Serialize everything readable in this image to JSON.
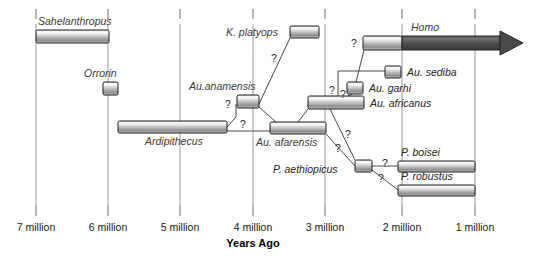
{
  "figure": {
    "axis_title": "Years Ago",
    "axis_ticks": [
      {
        "label": "7 million",
        "value": 7,
        "x": 36
      },
      {
        "label": "6 million",
        "value": 6,
        "x": 108
      },
      {
        "label": "5 million",
        "value": 5,
        "x": 180
      },
      {
        "label": "4 million",
        "value": 4,
        "x": 253
      },
      {
        "label": "3 million",
        "value": 3,
        "x": 325
      },
      {
        "label": "2 million",
        "value": 2,
        "x": 402
      },
      {
        "label": "1 million",
        "value": 1,
        "x": 475
      }
    ]
  },
  "chart_data": {
    "type": "bar",
    "title": "",
    "xlabel": "Years Ago",
    "ylabel": "",
    "xlim": [
      7.5,
      0.7
    ],
    "grid": true,
    "legend": "none",
    "orientation": "horizontal-ranges",
    "categories": [
      "Sahelanthropus",
      "Orrorin",
      "Ardipithecus",
      "Au.anamensis",
      "K. platyops",
      "Au. afarensis",
      "Au. africanus",
      "Au. garhi",
      "Au. sediba",
      "Homo",
      "P. aethiopicus",
      "P. boisei",
      "P. robustus"
    ],
    "ranges_mya": [
      {
        "name": "Sahelanthropus",
        "start": 7.0,
        "end": 6.0
      },
      {
        "name": "Orrorin",
        "start": 6.08,
        "end": 5.88
      },
      {
        "name": "Ardipithecus",
        "start": 5.86,
        "end": 4.36
      },
      {
        "name": "Au.anamensis",
        "start": 4.2,
        "end": 3.9
      },
      {
        "name": "K. platyops",
        "start": 3.5,
        "end": 3.1
      },
      {
        "name": "Au. afarensis",
        "start": 3.75,
        "end": 3.0
      },
      {
        "name": "Au. africanus",
        "start": 3.22,
        "end": 2.46
      },
      {
        "name": "Au. garhi",
        "start": 2.76,
        "end": 2.56
      },
      {
        "name": "Au. sediba",
        "start": 2.24,
        "end": 2.03
      },
      {
        "name": "Homo",
        "start": 2.54,
        "end": 0.2
      },
      {
        "name": "P. aethiopicus",
        "start": 2.65,
        "end": 2.42
      },
      {
        "name": "P. boisei",
        "start": 2.05,
        "end": 1.0
      },
      {
        "name": "P. robustus",
        "start": 2.05,
        "end": 1.0
      }
    ]
  },
  "taxa": [
    {
      "id": "sahelanthropus",
      "label": "Sahelanthropus",
      "bar": {
        "x": 36,
        "y": 30,
        "w": 73,
        "h": 13
      },
      "label_pos": {
        "x": 38,
        "y": 25,
        "anchor": "start"
      },
      "style": "light"
    },
    {
      "id": "orrorin",
      "label": "Orrorin",
      "bar": {
        "x": 103,
        "y": 82,
        "w": 15,
        "h": 13
      },
      "label_pos": {
        "x": 84,
        "y": 77,
        "anchor": "start"
      },
      "style": "light"
    },
    {
      "id": "ardipithecus",
      "label": "Ardipithecus",
      "bar": {
        "x": 118,
        "y": 121,
        "w": 109,
        "h": 12
      },
      "label_pos": {
        "x": 145,
        "y": 145,
        "anchor": "start"
      },
      "style": "light"
    },
    {
      "id": "au-anamensis",
      "label": "Au.anamensis",
      "bar": {
        "x": 237,
        "y": 95,
        "w": 22,
        "h": 13
      },
      "label_pos": {
        "x": 189,
        "y": 90,
        "anchor": "start"
      },
      "style": "light"
    },
    {
      "id": "k-platyops",
      "label": "K. platyops",
      "bar": {
        "x": 290,
        "y": 26,
        "w": 29,
        "h": 12
      },
      "label_pos": {
        "x": 226,
        "y": 36,
        "anchor": "start"
      },
      "style": "light"
    },
    {
      "id": "au-afarensis",
      "label": "Au. afarensis",
      "bar": {
        "x": 270,
        "y": 122,
        "w": 56,
        "h": 12
      },
      "label_pos": {
        "x": 256,
        "y": 146,
        "anchor": "start"
      },
      "style": "light"
    },
    {
      "id": "au-africanus",
      "label": "Au. africanus",
      "bar": {
        "x": 308,
        "y": 96,
        "w": 56,
        "h": 13
      },
      "label_pos": {
        "x": 370,
        "y": 107,
        "anchor": "start"
      },
      "style": "light"
    },
    {
      "id": "au-garhi",
      "label": "Au. garhi",
      "bar": {
        "x": 347,
        "y": 82,
        "w": 16,
        "h": 12
      },
      "label_pos": {
        "x": 369,
        "y": 92,
        "anchor": "start"
      },
      "style": "light"
    },
    {
      "id": "au-sediba",
      "label": "Au. sediba",
      "bar": {
        "x": 385,
        "y": 66,
        "w": 16,
        "h": 12
      },
      "label_pos": {
        "x": 407,
        "y": 76,
        "anchor": "start"
      },
      "style": "light"
    },
    {
      "id": "homo",
      "label": "Homo",
      "bar": {
        "x": 363,
        "y": 36,
        "w": 39,
        "h": 14
      },
      "label_pos": {
        "x": 425,
        "y": 31,
        "anchor": "middle"
      },
      "style": "light-then-dark"
    },
    {
      "id": "p-aethiopicus",
      "label": "P. aethiopicus",
      "bar": {
        "x": 355,
        "y": 160,
        "w": 17,
        "h": 12
      },
      "label_pos": {
        "x": 273,
        "y": 173,
        "anchor": "start"
      },
      "style": "light"
    },
    {
      "id": "p-boisei",
      "label": "P. boisei",
      "bar": {
        "x": 398,
        "y": 161,
        "w": 77,
        "h": 11
      },
      "label_pos": {
        "x": 401,
        "y": 156,
        "anchor": "start"
      },
      "style": "light"
    },
    {
      "id": "p-robustus",
      "label": "P. robustus",
      "bar": {
        "x": 398,
        "y": 185,
        "w": 77,
        "h": 11
      },
      "label_pos": {
        "x": 401,
        "y": 180,
        "anchor": "start"
      },
      "style": "light"
    }
  ],
  "uncertainty_marks": [
    {
      "id": "q-ardi-anam",
      "label": "?",
      "x": 228,
      "y": 108
    },
    {
      "id": "q-ardi-afar",
      "label": "?",
      "x": 243,
      "y": 128
    },
    {
      "id": "q-anam-platyops",
      "label": "?",
      "x": 274,
      "y": 62
    },
    {
      "id": "q-afar-africanus",
      "label": "?",
      "x": 332,
      "y": 94
    },
    {
      "id": "q-garhi",
      "label": "?",
      "x": 343,
      "y": 98
    },
    {
      "id": "q-homo",
      "label": "?",
      "x": 354,
      "y": 47
    },
    {
      "id": "q-aethiopicus-a",
      "label": "?",
      "x": 348,
      "y": 138
    },
    {
      "id": "q-aethiopicus-b",
      "label": "?",
      "x": 338,
      "y": 152
    },
    {
      "id": "q-boisei",
      "label": "?",
      "x": 385,
      "y": 167
    },
    {
      "id": "q-robustus",
      "label": "?",
      "x": 381,
      "y": 182
    }
  ],
  "connectors": [
    {
      "id": "ardipithecus-to-anamensis",
      "points": "227,127 236,117 236,104"
    },
    {
      "id": "ardipithecus-to-afarensis",
      "points": "227,131 270,131"
    },
    {
      "id": "anamensis-to-platyops",
      "points": "259,104 290,38"
    },
    {
      "id": "anamensis-to-afarensis",
      "points": "259,107 276,122"
    },
    {
      "id": "afarensis-to-africanus",
      "points": "298,122 318,96"
    },
    {
      "id": "africanus-to-garhi",
      "points": "348,96 352,94"
    },
    {
      "id": "africanus-to-sediba",
      "points": "338,96 338,71 385,71"
    },
    {
      "id": "garhi-to-homo",
      "points": "356,82 364,50"
    },
    {
      "id": "afarensis-to-aethiopicus",
      "points": "326,134 355,166"
    },
    {
      "id": "aethiopicus-to-boisei",
      "points": "372,166 398,166"
    },
    {
      "id": "aethiopicus-to-robustus",
      "points": "372,170 398,190"
    },
    {
      "id": "africanus-to-aethiopicus-alt",
      "points": "330,109 355,160"
    }
  ]
}
